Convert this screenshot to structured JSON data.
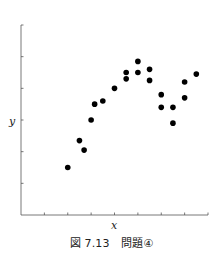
{
  "caption": "図 7.13　問題④",
  "chart_data": {
    "type": "scatter",
    "title": "",
    "xlabel": "x",
    "ylabel": "y",
    "xlim": [
      0,
      8
    ],
    "ylim": [
      0,
      6
    ],
    "x_ticks": [
      0,
      1,
      2,
      3,
      4,
      5,
      6,
      7,
      8
    ],
    "y_ticks": [
      0,
      1,
      2,
      3,
      4,
      5,
      6
    ],
    "tick_labels_shown": false,
    "grid": false,
    "legend": null,
    "series": [
      {
        "name": "data",
        "color": "#000000",
        "points": [
          {
            "x": 2.0,
            "y": 1.5
          },
          {
            "x": 2.5,
            "y": 2.35
          },
          {
            "x": 2.7,
            "y": 2.05
          },
          {
            "x": 3.0,
            "y": 3.0
          },
          {
            "x": 3.15,
            "y": 3.5
          },
          {
            "x": 3.5,
            "y": 3.6
          },
          {
            "x": 4.0,
            "y": 4.0
          },
          {
            "x": 4.5,
            "y": 4.5
          },
          {
            "x": 4.5,
            "y": 4.3
          },
          {
            "x": 5.0,
            "y": 4.85
          },
          {
            "x": 5.0,
            "y": 4.5
          },
          {
            "x": 5.5,
            "y": 4.6
          },
          {
            "x": 5.5,
            "y": 4.25
          },
          {
            "x": 6.0,
            "y": 3.8
          },
          {
            "x": 6.0,
            "y": 3.4
          },
          {
            "x": 6.5,
            "y": 3.4
          },
          {
            "x": 6.5,
            "y": 2.9
          },
          {
            "x": 7.0,
            "y": 4.2
          },
          {
            "x": 7.0,
            "y": 3.7
          },
          {
            "x": 7.5,
            "y": 4.45
          }
        ]
      }
    ]
  }
}
